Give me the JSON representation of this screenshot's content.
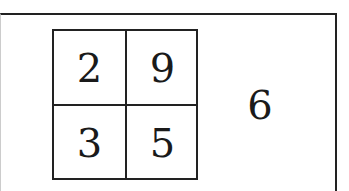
{
  "grid": {
    "cells": [
      [
        "2",
        "9"
      ],
      [
        "3",
        "5"
      ]
    ]
  },
  "side_value": "6"
}
